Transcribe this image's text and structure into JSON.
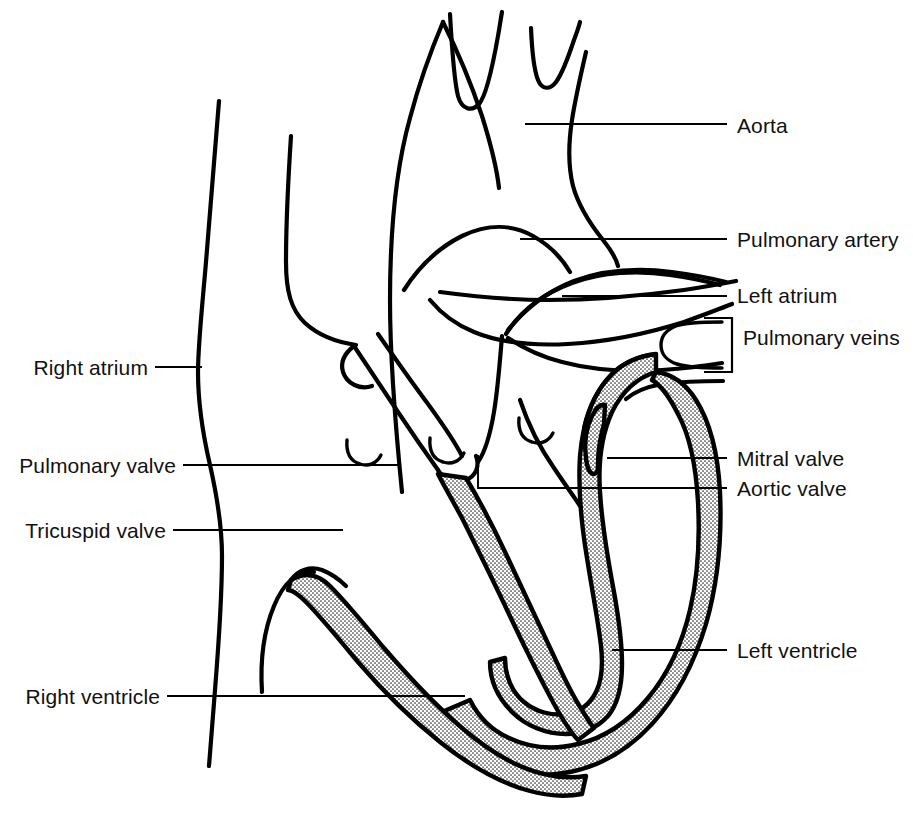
{
  "figure": {
    "width": 913,
    "height": 813,
    "background_color": "#ffffff",
    "line_color": "#000000",
    "text_color": "#111111",
    "stipple_fill_description": "fine dot halftone shading on ventricular myocardium"
  },
  "labels": {
    "aorta": "Aorta",
    "pulmonary_artery": "Pulmonary artery",
    "left_atrium": "Left atrium",
    "pulmonary_veins": "Pulmonary veins",
    "mitral_valve": "Mitral valve",
    "aortic_valve": "Aortic valve",
    "left_ventricle": "Left ventricle",
    "right_atrium": "Right atrium",
    "pulmonary_valve": "Pulmonary valve",
    "tricuspid_valve": "Tricuspid valve",
    "right_ventricle": "Right ventricle"
  },
  "label_list": [
    {
      "key": "right_atrium",
      "text": "Right atrium",
      "side": "left",
      "x": 148,
      "y": 374
    },
    {
      "key": "pulmonary_valve",
      "text": "Pulmonary valve",
      "side": "left",
      "x": 176,
      "y": 472
    },
    {
      "key": "tricuspid_valve",
      "text": "Tricuspid valve",
      "side": "left",
      "x": 166,
      "y": 537
    },
    {
      "key": "right_ventricle",
      "text": "Right ventricle",
      "side": "left",
      "x": 160,
      "y": 703
    },
    {
      "key": "aorta",
      "text": "Aorta",
      "side": "right",
      "x": 737,
      "y": 133
    },
    {
      "key": "pulmonary_artery",
      "text": "Pulmonary artery",
      "side": "right",
      "x": 737,
      "y": 247
    },
    {
      "key": "left_atrium",
      "text": "Left atrium",
      "side": "right",
      "x": 737,
      "y": 303
    },
    {
      "key": "pulmonary_veins",
      "text": "Pulmonary veins",
      "side": "right",
      "x": 743,
      "y": 341
    },
    {
      "key": "mitral_valve",
      "text": "Mitral valve",
      "side": "right",
      "x": 737,
      "y": 466
    },
    {
      "key": "aortic_valve",
      "text": "Aortic valve",
      "side": "right",
      "x": 737,
      "y": 496
    },
    {
      "key": "left_ventricle",
      "text": "Left ventricle",
      "side": "right",
      "x": 737,
      "y": 658
    }
  ],
  "anatomy_parts": [
    "aorta",
    "aortic-arch",
    "brachiocephalic-branches",
    "pulmonary-artery",
    "left-atrium",
    "pulmonary-veins",
    "right-atrium",
    "superior-vena-cava",
    "pulmonary-valve",
    "tricuspid-valve",
    "mitral-valve",
    "aortic-valve",
    "left-ventricle-wall",
    "right-ventricle-wall",
    "interventricular-septum"
  ]
}
